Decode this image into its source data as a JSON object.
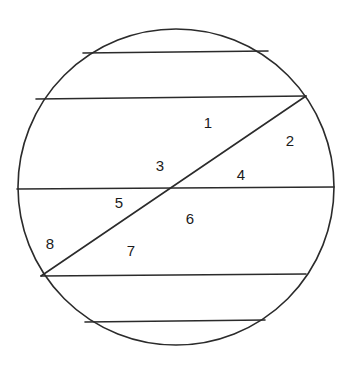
{
  "figure": {
    "name": "circle-with-chords-and-diagonal",
    "background_color": "#ffffff",
    "stroke_color": "#2b2b2b",
    "label_color": "#1b1b1b",
    "stroke_width": 1.6,
    "circle": {
      "name": "outer-circle",
      "center_x": 176,
      "center_y": 187,
      "radius": 158
    },
    "chords": [
      {
        "name": "chord-1-top",
        "orientation": "horizontal",
        "x1": 83,
        "y1": 53,
        "x2": 268,
        "y2": 51
      },
      {
        "name": "chord-2-upper",
        "orientation": "horizontal",
        "x1": 36,
        "y1": 99,
        "x2": 306,
        "y2": 96
      },
      {
        "name": "chord-3-middle",
        "orientation": "horizontal",
        "x1": 17,
        "y1": 189,
        "x2": 334,
        "y2": 187
      },
      {
        "name": "chord-4-lower",
        "orientation": "horizontal",
        "x1": 41,
        "y1": 276,
        "x2": 306,
        "y2": 274
      },
      {
        "name": "chord-5-bottom",
        "orientation": "horizontal",
        "x1": 85,
        "y1": 322,
        "x2": 265,
        "y2": 320
      },
      {
        "name": "chord-diagonal",
        "orientation": "diagonal",
        "x1": 41,
        "y1": 276,
        "x2": 306,
        "y2": 96
      }
    ],
    "labels": [
      {
        "name": "region-label-1",
        "text": "1",
        "x": 208,
        "y": 124
      },
      {
        "name": "region-label-2",
        "text": "2",
        "x": 290,
        "y": 142
      },
      {
        "name": "region-label-3",
        "text": "3",
        "x": 160,
        "y": 167
      },
      {
        "name": "region-label-4",
        "text": "4",
        "x": 241,
        "y": 176
      },
      {
        "name": "region-label-5",
        "text": "5",
        "x": 119,
        "y": 204
      },
      {
        "name": "region-label-6",
        "text": "6",
        "x": 190,
        "y": 220
      },
      {
        "name": "region-label-7",
        "text": "7",
        "x": 131,
        "y": 252
      },
      {
        "name": "region-label-8",
        "text": "8",
        "x": 50,
        "y": 245
      }
    ]
  }
}
